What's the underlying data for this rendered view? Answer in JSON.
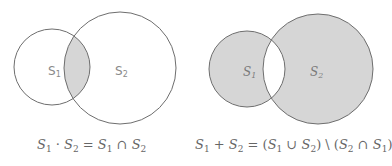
{
  "diagrams": [
    {
      "id": "intersection",
      "labels": {
        "s1": "S",
        "s1_sub": "1",
        "s2": "S",
        "s2_sub": "2"
      },
      "shaded_region": "S1 ∩ S2",
      "formula": {
        "parts": [
          "S",
          "1",
          " · ",
          "S",
          "2",
          " = ",
          "S",
          "1",
          " ∩ ",
          "S",
          "2"
        ],
        "text": "S1 · S2 = S1 ∩ S2"
      }
    },
    {
      "id": "symmetric-difference",
      "labels": {
        "s1": "S",
        "s1_sub": "1",
        "s2": "S",
        "s2_sub": "2"
      },
      "shaded_region": "(S1 ∪ S2) \\ (S2 ∩ S1)",
      "formula": {
        "parts": [
          "S",
          "1",
          " + ",
          "S",
          "2",
          " = (",
          "S",
          "1",
          " ∪ ",
          "S",
          "2",
          ") \\ (",
          "S",
          "2",
          " ∩ ",
          "S",
          "1",
          ")"
        ],
        "text": "S1 + S2 = (S1 ∪ S2) \\ (S2 ∩ S1)"
      }
    }
  ],
  "colors": {
    "stroke": "#6e6e6e",
    "fill": "#d6d6d6",
    "background": "#ffffff",
    "text": "#666666"
  }
}
